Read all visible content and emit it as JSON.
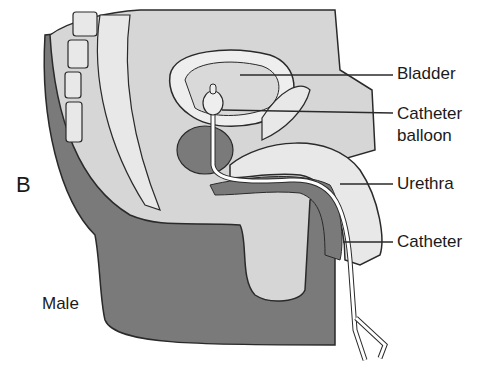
{
  "figure": {
    "panel_letter": "B",
    "subject_label": "Male",
    "labels": [
      {
        "id": "bladder",
        "text": "Bladder"
      },
      {
        "id": "catheter-balloon",
        "text": "Catheter balloon",
        "line1": "Catheter",
        "line2": "balloon"
      },
      {
        "id": "urethra",
        "text": "Urethra"
      },
      {
        "id": "catheter",
        "text": "Catheter"
      }
    ],
    "colors": {
      "dark_tissue": "#7a7a7a",
      "light_tissue": "#d6d6d6",
      "pale_tissue": "#e8e8e8",
      "outline": "#2a2a2a",
      "background": "#ffffff"
    }
  }
}
